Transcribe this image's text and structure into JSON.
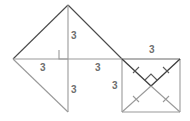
{
  "figure": {
    "canvas": {
      "width": 190,
      "height": 121
    },
    "colors": {
      "stroke_light": "#9a9a9a",
      "stroke_dark": "#4a4a4a",
      "label_text": "#6e6e6e",
      "background": "#ffffff"
    },
    "points": {
      "left_vertex": {
        "x": 13,
        "y": 59
      },
      "apex": {
        "x": 68,
        "y": 5
      },
      "foot": {
        "x": 68,
        "y": 59
      },
      "bottom_vertex": {
        "x": 68,
        "y": 112
      },
      "mid_right": {
        "x": 122,
        "y": 59
      },
      "square_top_right": {
        "x": 180,
        "y": 59
      },
      "square_bottom_left": {
        "x": 122,
        "y": 112
      },
      "square_bottom_right": {
        "x": 180,
        "y": 112
      },
      "diagonal_crossing": {
        "x": 151,
        "y": 86
      }
    },
    "labels": [
      {
        "id": "label-altitude-upper",
        "text": "3",
        "x": 71,
        "y": 31
      },
      {
        "id": "label-base-left",
        "text": "3",
        "x": 40,
        "y": 63
      },
      {
        "id": "label-base-right",
        "text": "3",
        "x": 95,
        "y": 63
      },
      {
        "id": "label-altitude-lower",
        "text": "3",
        "x": 71,
        "y": 85
      },
      {
        "id": "label-square-top",
        "text": "3",
        "x": 149,
        "y": 45
      },
      {
        "id": "label-square-left",
        "text": "3",
        "x": 112,
        "y": 81
      }
    ],
    "marks": {
      "right_angle_foot": "right-angle-square-at-foot",
      "right_angle_diagonals": "right-angle-square-at-diagonal-crossing",
      "tick_marks": "congruence-ticks-on-square-diagonals",
      "tick_count": 4
    }
  }
}
